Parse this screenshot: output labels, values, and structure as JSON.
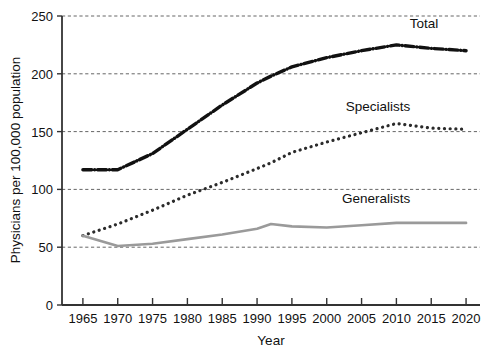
{
  "chart_data": {
    "type": "line",
    "title": "",
    "xlabel": "Year",
    "ylabel": "Physicians per 100,000 population",
    "xlim": [
      1962,
      2022
    ],
    "ylim": [
      0,
      250
    ],
    "grid": true,
    "grid_axis": "y",
    "legend_position": "inline-right-of-series",
    "x_ticks": [
      1965,
      1970,
      1975,
      1980,
      1985,
      1990,
      1995,
      2000,
      2005,
      2010,
      2015,
      2020
    ],
    "x_tick_labels": [
      "1965",
      "1970",
      "1975",
      "1980",
      "1985",
      "1990",
      "1995",
      "2000",
      "2005",
      "2010",
      "2015",
      "2020"
    ],
    "y_ticks": [
      0,
      50,
      100,
      150,
      200,
      250
    ],
    "y_tick_labels": [
      "0",
      "50",
      "100",
      "150",
      "200",
      "250"
    ],
    "x": [
      1965,
      1970,
      1975,
      1980,
      1985,
      1990,
      1992,
      1995,
      2000,
      2005,
      2010,
      2015,
      2020
    ],
    "series": [
      {
        "name": "Total",
        "label": "Total",
        "style": "dash-dot",
        "color": "#111111",
        "width": 3.4,
        "values": [
          117,
          117,
          131,
          152,
          173,
          192,
          198,
          206,
          214,
          220,
          225,
          222,
          220
        ]
      },
      {
        "name": "Specialists",
        "label": "Specialists",
        "style": "dotted",
        "color": "#2b2b2b",
        "width": 3.2,
        "values": [
          60,
          70,
          82,
          95,
          106,
          118,
          123,
          132,
          141,
          149,
          157,
          153,
          152
        ]
      },
      {
        "name": "Generalists",
        "label": "Generalists",
        "style": "solid",
        "color": "#9a9a9a",
        "width": 2.6,
        "values": [
          60,
          51,
          53,
          57,
          61,
          66,
          70,
          68,
          67,
          69,
          71,
          71,
          71
        ]
      }
    ],
    "annotations": [
      {
        "text": "Total",
        "x": 2016,
        "y": 240
      },
      {
        "text": "Specialists",
        "x": 2012,
        "y": 168
      },
      {
        "text": "Generalists",
        "x": 2012,
        "y": 88
      }
    ]
  },
  "axes": {
    "y_title": "Physicians per 100,000 population",
    "x_title": "Year"
  }
}
